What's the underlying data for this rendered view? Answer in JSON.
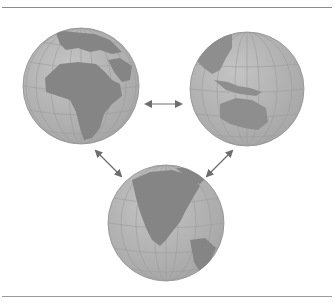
{
  "figure": {
    "colors": {
      "ocean": "#b3b3b3",
      "land": "#858585",
      "grid": "#9c9c9c",
      "arrow": "#6e6e6e",
      "rule": "#8a8a8a"
    },
    "globes": [
      {
        "name": "Europe and Africa view",
        "cx": 81,
        "cy": 86,
        "r": 58
      },
      {
        "name": "Asia and Australia view",
        "cx": 247,
        "cy": 89,
        "r": 57
      },
      {
        "name": "North America view",
        "cx": 166,
        "cy": 223,
        "r": 58
      }
    ],
    "arrows": [
      {
        "name": "left-right",
        "from": "Europe and Africa view",
        "to": "Asia and Australia view"
      },
      {
        "name": "left-bottom",
        "from": "Europe and Africa view",
        "to": "North America view"
      },
      {
        "name": "right-bottom",
        "from": "Asia and Australia view",
        "to": "North America view"
      }
    ]
  }
}
